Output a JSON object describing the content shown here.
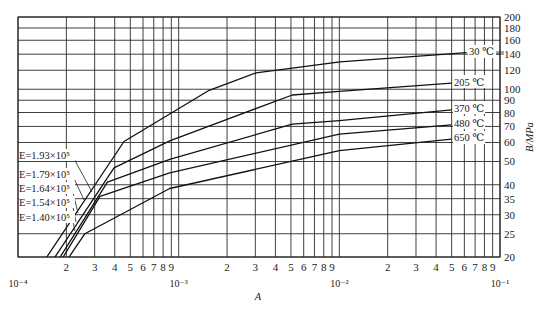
{
  "chart_data": {
    "type": "line",
    "title": "",
    "xlabel": "A",
    "ylabel": "B/MPa",
    "xscale": "log",
    "yscale": "log",
    "xlim": [
      0.0001,
      0.1
    ],
    "ylim": [
      20,
      200
    ],
    "grid": true,
    "x_decade_labels": [
      "10⁻⁴",
      "10⁻³",
      "10⁻²",
      "10⁻¹"
    ],
    "x_minor_tick_labels": [
      "2",
      "3",
      "4",
      "5",
      "6",
      "7",
      "8",
      "9"
    ],
    "y_tick_labels": [
      "200",
      "180",
      "160",
      "140",
      "120",
      "100",
      "90",
      "80",
      "70",
      "60",
      "50",
      "40",
      "35",
      "30",
      "25",
      "20"
    ],
    "series": [
      {
        "name": "30 ℃",
        "modulus_label": "E=1.93×10⁵",
        "x": [
          0.000151,
          0.000457,
          0.00155,
          0.00303,
          0.0101,
          0.062
        ],
        "y": [
          20,
          60.6,
          99,
          117,
          130,
          142
        ]
      },
      {
        "name": "205 ℃",
        "modulus_label": "E=1.79×10⁵",
        "x": [
          0.00017,
          0.000396,
          0.00088,
          0.0051,
          0.01,
          0.05
        ],
        "y": [
          20,
          47,
          61,
          94.6,
          98,
          106
        ]
      },
      {
        "name": "370 ℃",
        "modulus_label": "E=1.64×10⁵",
        "x": [
          0.000183,
          0.00036,
          0.00088,
          0.0051,
          0.01,
          0.05
        ],
        "y": [
          20,
          41,
          51,
          71.5,
          74,
          82
        ]
      },
      {
        "name": "480 ℃",
        "modulus_label": "E=1.54×10⁵",
        "x": [
          0.000191,
          0.000324,
          0.00088,
          0.01,
          0.05
        ],
        "y": [
          20,
          35.8,
          44.8,
          65,
          71
        ]
      },
      {
        "name": "650 ℃",
        "modulus_label": "E=1.40×10⁵",
        "x": [
          0.000208,
          0.000261,
          0.00088,
          0.01,
          0.05
        ],
        "y": [
          20,
          25,
          38.6,
          55.5,
          62
        ]
      }
    ],
    "legend_position": "inline labels: temperatures at right end of curves, moduli at left with leader lines"
  },
  "axes": {
    "x_title": "A",
    "y_title": "B/MPa"
  },
  "labels": {
    "temps": [
      "30 ℃",
      "205 ℃",
      "370 ℃",
      "480 ℃",
      "650 ℃"
    ],
    "moduli": [
      "E=1.93×10⁵",
      "E=1.79×10⁵",
      "E=1.64×10⁵",
      "E=1.54×10⁵",
      "E=1.40×10⁵"
    ]
  },
  "colors": {
    "line": "#111111",
    "grid": "#2a2a2a",
    "background": "#ffffff"
  }
}
